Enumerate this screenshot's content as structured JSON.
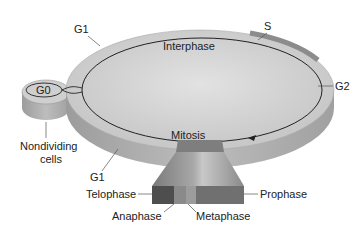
{
  "diagram": {
    "labels": {
      "g1_top": "G1",
      "s": "S",
      "g2": "G2",
      "g0": "G0",
      "interphase": "Interphase",
      "mitosis": "Mitosis",
      "nondividing_line1": "Nondividing",
      "nondividing_line2": "cells",
      "g1_bottom": "G1",
      "telophase": "Telophase",
      "prophase": "Prophase",
      "anaphase": "Anaphase",
      "metaphase": "Metaphase"
    },
    "colors": {
      "disc_top": "#d4d4d4",
      "disc_side": "#a8a8a8",
      "mitosis_dark": "#5a5a5a",
      "mitosis_light": "#9a9a9a",
      "line": "#222222"
    }
  }
}
